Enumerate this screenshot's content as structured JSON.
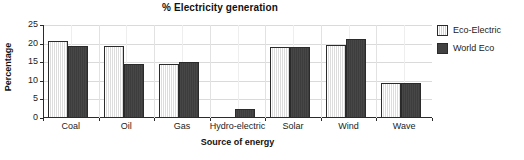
{
  "chart_data": {
    "type": "bar",
    "title": "% Electricity generation",
    "xlabel": "Source of energy",
    "ylabel": "Percentage",
    "categories": [
      "Coal",
      "Oil",
      "Gas",
      "Hydro-electric",
      "Solar",
      "Wind",
      "Wave"
    ],
    "series": [
      {
        "name": "Eco-Electric",
        "color": "#e6e6e6",
        "values": [
          20.7,
          19.3,
          14.5,
          0,
          19.0,
          19.5,
          9.5
        ]
      },
      {
        "name": "World Eco",
        "color": "#424242",
        "values": [
          19.3,
          14.5,
          15.1,
          2.5,
          19.0,
          21.3,
          9.5
        ]
      }
    ],
    "ylim": [
      0,
      25
    ],
    "yticks": [
      0,
      5,
      10,
      15,
      20,
      25
    ],
    "ytick_labels": [
      "0",
      "5",
      "10",
      "15",
      "20",
      "25"
    ],
    "grid": true,
    "legend_position": "right"
  }
}
